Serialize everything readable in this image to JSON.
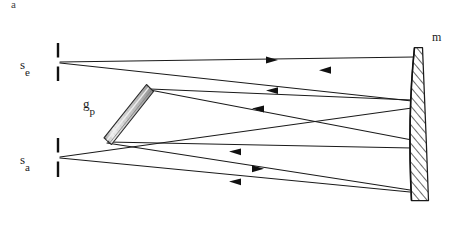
{
  "figure": {
    "panel_label": "a",
    "caption_visible": false,
    "type": "optical-ray-diagram",
    "width": 461,
    "height": 227,
    "background_color": "#ffffff",
    "line_color": "#1a1a1a"
  },
  "labels": {
    "panel": "a",
    "source_entrance": {
      "base": "s",
      "sub": "e"
    },
    "source_exit": {
      "base": "s",
      "sub": "a"
    },
    "grating": {
      "base": "g",
      "sub": "p"
    },
    "mirror": "m"
  },
  "components": [
    {
      "id": "entrance-slit",
      "name": "entrance-slit",
      "label": "s_e",
      "x": 58,
      "y": 62,
      "upper_bar": {
        "x": 58,
        "y1": 44,
        "y2": 58
      },
      "lower_bar": {
        "x": 58,
        "y1": 66,
        "y2": 80
      }
    },
    {
      "id": "exit-slit",
      "name": "exit-slit",
      "label": "s_a",
      "x": 58,
      "y": 157,
      "upper_bar": {
        "x": 58,
        "y1": 139,
        "y2": 153
      },
      "lower_bar": {
        "x": 58,
        "y1": 161,
        "y2": 176
      }
    },
    {
      "id": "grating",
      "name": "diffraction-grating",
      "label": "g_p",
      "top_x": 148,
      "top_y": 88,
      "bottom_x": 106,
      "bottom_y": 141,
      "thickness": 11,
      "fill": "#d8d8d8"
    },
    {
      "id": "mirror",
      "name": "concave-mirror",
      "label": "m",
      "top_x": 416,
      "top_y": 48,
      "bottom_x": 412,
      "bottom_y": 201,
      "hatch_fill": "#ffffff",
      "hatch_stroke": "#1a1a1a"
    }
  ],
  "rays": [
    {
      "id": "ray-1",
      "from": "entrance-slit",
      "to": "mirror",
      "x1": 60,
      "y1": 62,
      "x2": 414,
      "y2": 57,
      "arrow_at": {
        "x": 272,
        "y": 60,
        "dir": "right"
      }
    },
    {
      "id": "ray-2",
      "from": "entrance-slit",
      "to": "grating-top",
      "x1": 60,
      "y1": 63,
      "x2": 412,
      "y2": 101,
      "arrow_at": {
        "x": 326,
        "y": 71,
        "dir": "left"
      }
    },
    {
      "id": "ray-3",
      "from": "mirror",
      "to": "grating-top",
      "x1": 412,
      "y1": 100,
      "x2": 150,
      "y2": 89,
      "arrow_at": {
        "x": 273,
        "y": 91,
        "dir": "left"
      }
    },
    {
      "id": "ray-4",
      "from": "grating-top",
      "to": "mirror",
      "x1": 150,
      "y1": 90,
      "x2": 412,
      "y2": 140,
      "arrow_at": {
        "x": 258,
        "y": 110,
        "dir": "left"
      }
    },
    {
      "id": "ray-5",
      "from": "mirror",
      "to": "grating-bottom",
      "x1": 412,
      "y1": 148,
      "x2": 108,
      "y2": 142,
      "arrow_at": {
        "x": 236,
        "y": 152,
        "dir": "left"
      }
    },
    {
      "id": "ray-6",
      "from": "grating-bottom",
      "to": "exit-slit",
      "x1": 107,
      "y1": 143,
      "x2": 410,
      "y2": 190,
      "arrow_at": {
        "x": 258,
        "y": 168,
        "dir": "right"
      }
    },
    {
      "id": "ray-7",
      "from": "exit-slit",
      "to": "mirror",
      "x1": 60,
      "y1": 157,
      "x2": 412,
      "y2": 108,
      "arrow_at": {
        "x": 236,
        "y": 182,
        "dir": "left"
      }
    },
    {
      "id": "ray-8",
      "from": "exit-slit",
      "to": "mirror",
      "x1": 60,
      "y1": 158,
      "x2": 410,
      "y2": 192,
      "arrow_at": null
    }
  ],
  "colors": {
    "ink": "#1a1a1a",
    "grating_fill_light": "#efefef",
    "grating_fill_dark": "#b9b9b9",
    "paper": "#ffffff"
  }
}
